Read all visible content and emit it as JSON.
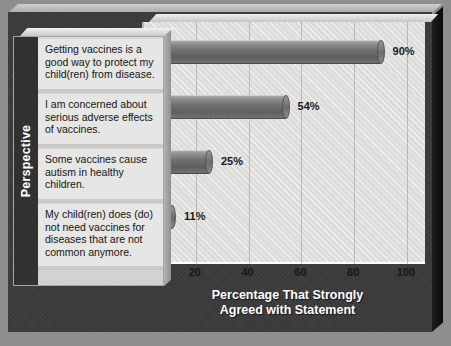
{
  "chart_data": {
    "type": "bar",
    "orientation": "horizontal",
    "title": "",
    "xlabel": "Percentage That Strongly Agreed with Statement",
    "ylabel": "Perspective",
    "categories": [
      "Getting vaccines is a good way to protect my child(ren) from disease.",
      "I am concerned about serious adverse effects of vaccines.",
      "Some vaccines cause autism in healthy children.",
      "My child(ren) does (do) not need vaccines for diseases that are not common anymore."
    ],
    "values": [
      90,
      54,
      25,
      11
    ],
    "value_labels": [
      "90%",
      "54%",
      "25%",
      "11%"
    ],
    "xlim": [
      0,
      100
    ],
    "xticks": [
      "0",
      "20",
      "40",
      "60",
      "80",
      "100"
    ],
    "grid": true,
    "legend": "none",
    "style": "3d-cylinder-bars",
    "colors": {
      "bar": "#6f6f6f",
      "plot_background": "#dededc",
      "chart_background": "#3b3b3b",
      "label_panel": "#e6e6e4",
      "axis_strip": "#2f2f2f",
      "axis_title_text": "#ffffff",
      "tick_text": "#171717"
    }
  },
  "axis_title_lines": {
    "line1": "Percentage That Strongly",
    "line2": "Agreed with Statement"
  }
}
